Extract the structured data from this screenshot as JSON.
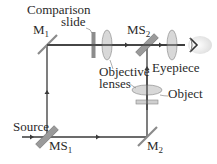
{
  "diagram": {
    "labels": {
      "comparison_slide_line1": "Comparison",
      "comparison_slide_line2": "slide",
      "m1": "M",
      "m1_sub": "1",
      "ms2": "MS",
      "ms2_sub": "2",
      "objective_line1": "Objective",
      "objective_line2": "lenses",
      "eyepiece": "Eyepiece",
      "object": "Object",
      "source": "Source",
      "ms1": "MS",
      "ms1_sub": "1",
      "m2": "M",
      "m2_sub": "2"
    },
    "colors": {
      "beam": "#3a3a3a",
      "mirror": "#8a8a8a",
      "splitter": "#777777",
      "lens_fill": "#d8d8d8",
      "lens_stroke": "#9a9a9a",
      "slide": "#8c8c8c",
      "text": "#2a2a2a"
    }
  }
}
